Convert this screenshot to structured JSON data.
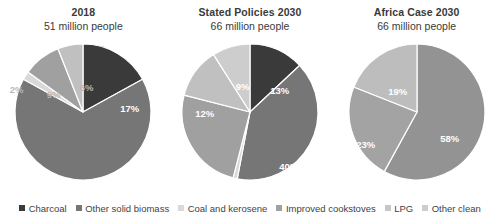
{
  "chart_data": {
    "type": "pie",
    "title": "",
    "legend_position": "bottom",
    "categories": [
      "Charcoal",
      "Other solid biomass",
      "Coal and kerosene",
      "Improved cookstoves",
      "LPG",
      "Other clean"
    ],
    "colors": [
      "#3a3a3a",
      "#767676",
      "#d9d9d9",
      "#a0a0a0",
      "#c0c0c0",
      "#cdcdcd"
    ],
    "charts": [
      {
        "title": "2018",
        "subtitle": "51 million people",
        "labels": [
          "Charcoal",
          "Other solid biomass",
          "Coal and kerosene",
          "Improved cookstoves",
          "LPG",
          "Other clean"
        ],
        "values": [
          17,
          66,
          2,
          9,
          6,
          0
        ],
        "value_labels": [
          "17%",
          "66%",
          "2%",
          "9%",
          "6%",
          ""
        ]
      },
      {
        "title": "Stated Policies 2030",
        "subtitle": "66 million people",
        "labels": [
          "Charcoal",
          "Other solid biomass",
          "Coal and kerosene",
          "Improved cookstoves",
          "LPG",
          "Other clean"
        ],
        "values": [
          13,
          40,
          1,
          25,
          12,
          9
        ],
        "value_labels": [
          "13%",
          "40%",
          "1%",
          "25%",
          "12%",
          "9%"
        ]
      },
      {
        "title": "Africa Case 2030",
        "subtitle": "66 million people",
        "labels": [
          "Other solid biomass",
          "Improved cookstoves",
          "LPG"
        ],
        "values": [
          58,
          23,
          19
        ],
        "value_labels": [
          "58%",
          "23%",
          "19%"
        ]
      }
    ]
  },
  "panels": [
    {
      "title": "2018",
      "subtitle": "51 million people",
      "slices": [
        {
          "name": "charcoal",
          "label": "17%",
          "color": "#3a3a3a",
          "start": 0,
          "end": 61.2,
          "lx": 130,
          "ly": 74,
          "anchor": "middle",
          "style": "in"
        },
        {
          "name": "other-solid-biomass",
          "label": "66%",
          "color": "#767676",
          "start": 61.2,
          "end": 298.8,
          "lx": 82,
          "ly": 164,
          "anchor": "middle",
          "style": "in"
        },
        {
          "name": "coal-and-kerosene",
          "label": "2%",
          "color": "#d9d9d9",
          "start": 298.8,
          "end": 306.0,
          "lx": 17,
          "ly": 55,
          "anchor": "middle",
          "style": "out"
        },
        {
          "name": "improved-cookstoves",
          "label": "9%",
          "color": "#a0a0a0",
          "start": 306.0,
          "end": 338.4,
          "lx": 54,
          "ly": 60,
          "anchor": "middle",
          "style": "out"
        },
        {
          "name": "lpg",
          "label": "6%",
          "color": "#c0c0c0",
          "start": 338.4,
          "end": 360.0,
          "lx": 87,
          "ly": 53,
          "anchor": "middle",
          "style": "out"
        }
      ]
    },
    {
      "title": "Stated Policies 2030",
      "subtitle": "66 million people",
      "slices": [
        {
          "name": "charcoal",
          "label": "13%",
          "color": "#3a3a3a",
          "start": 0,
          "end": 46.8,
          "lx": 113,
          "ly": 56,
          "anchor": "middle",
          "style": "in"
        },
        {
          "name": "other-solid-biomass",
          "label": "40%",
          "color": "#767676",
          "start": 46.8,
          "end": 190.8,
          "lx": 122,
          "ly": 132,
          "anchor": "middle",
          "style": "in"
        },
        {
          "name": "coal-and-kerosene",
          "label": "1%",
          "color": "#d9d9d9",
          "start": 190.8,
          "end": 194.4,
          "lx": 64,
          "ly": 176,
          "anchor": "middle",
          "style": "out"
        },
        {
          "name": "improved-cookstoves",
          "label": "25%",
          "color": "#a0a0a0",
          "start": 194.4,
          "end": 284.4,
          "lx": 33,
          "ly": 133,
          "anchor": "middle",
          "style": "in"
        },
        {
          "name": "lpg",
          "label": "12%",
          "color": "#c0c0c0",
          "start": 284.4,
          "end": 327.6,
          "lx": 38,
          "ly": 79,
          "anchor": "middle",
          "style": "in"
        },
        {
          "name": "other-clean",
          "label": "9%",
          "color": "#cdcdcd",
          "start": 327.6,
          "end": 360.0,
          "lx": 76,
          "ly": 52,
          "anchor": "middle",
          "style": "in"
        }
      ]
    },
    {
      "title": "Africa Case 2030",
      "subtitle": "66 million people",
      "slices": [
        {
          "name": "other-solid-biomass",
          "label": "58%",
          "color": "#939393",
          "start": 0,
          "end": 208.8,
          "lx": 116,
          "ly": 104,
          "anchor": "middle",
          "style": "in"
        },
        {
          "name": "improved-cookstoves",
          "label": "23%",
          "color": "#a3a3a3",
          "start": 208.8,
          "end": 291.6,
          "lx": 32,
          "ly": 110,
          "anchor": "middle",
          "style": "in"
        },
        {
          "name": "lpg",
          "label": "19%",
          "color": "#bdbdbd",
          "start": 291.6,
          "end": 360.0,
          "lx": 64,
          "ly": 57,
          "anchor": "middle",
          "style": "in"
        }
      ]
    }
  ],
  "legend": {
    "items": [
      {
        "label": "Charcoal",
        "color": "#3a3a3a"
      },
      {
        "label": "Other solid biomass",
        "color": "#767676"
      },
      {
        "label": "Coal and kerosene",
        "color": "#d9d9d9"
      },
      {
        "label": "Improved cookstoves",
        "color": "#a0a0a0"
      },
      {
        "label": "LPG",
        "color": "#c6c6c6"
      },
      {
        "label": "Other clean",
        "color": "#cdcdcd"
      }
    ]
  }
}
